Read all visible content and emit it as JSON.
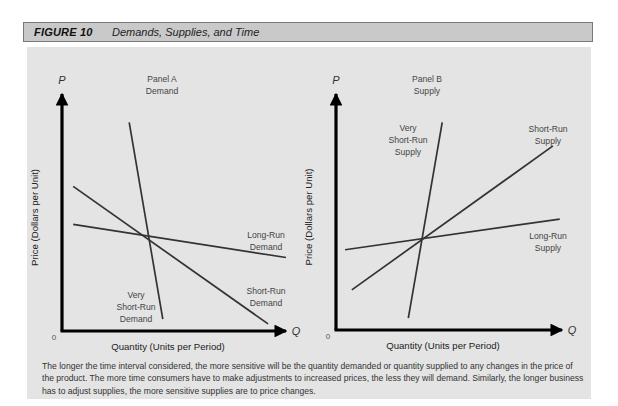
{
  "header": {
    "figure_number": "FIGURE 10",
    "title": "Demands, Supplies, and Time"
  },
  "caption": "The longer the time interval considered, the more sensitive will be the quantity demanded or quantity supplied to any changes in the price of the product. The more time consumers have to make adjustments to increased prices, the less they will demand. Similarly, the longer business has to adjust supplies, the more sensitive supplies are to price changes.",
  "colors": {
    "header_bg": "#c9c9c9",
    "panel_bg": "#e4e4e4",
    "axis": "#000000",
    "curve": "#333333",
    "label": "#444444"
  },
  "chart_data": [
    {
      "type": "line",
      "panel": "A",
      "title": "Panel A\nDemand",
      "title_lines": [
        "Panel A",
        "Demand"
      ],
      "xlabel": "Quantity (Units per Period)",
      "ylabel": "Price (Dollars per Unit)",
      "x_axis_symbol": "Q",
      "y_axis_symbol": "P",
      "origin_label": "0",
      "grid": false,
      "series": [
        {
          "name": "Very Short-Run Demand",
          "label_lines": [
            "Very",
            "Short-Run",
            "Demand"
          ],
          "points": [
            [
              0.3,
              0.88
            ],
            [
              0.45,
              0.05
            ]
          ]
        },
        {
          "name": "Short-Run Demand",
          "label_lines": [
            "Short-Run",
            "Demand"
          ],
          "points": [
            [
              0.05,
              0.61
            ],
            [
              0.92,
              0.03
            ]
          ]
        },
        {
          "name": "Long-Run Demand",
          "label_lines": [
            "Long-Run",
            "Demand"
          ],
          "points": [
            [
              0.05,
              0.45
            ],
            [
              1.0,
              0.31
            ]
          ]
        }
      ],
      "intersection": [
        0.38,
        0.42
      ]
    },
    {
      "type": "line",
      "panel": "B",
      "title": "Panel B\nSupply",
      "title_lines": [
        "Panel B",
        "Supply"
      ],
      "xlabel": "Quantity (Units per Period)",
      "ylabel": "Price (Dollars per Unit)",
      "x_axis_symbol": "Q",
      "y_axis_symbol": "P",
      "origin_label": "0",
      "grid": false,
      "series": [
        {
          "name": "Very Short-Run Supply",
          "label_lines": [
            "Very",
            "Short-Run",
            "Supply"
          ],
          "points": [
            [
              0.32,
              0.05
            ],
            [
              0.47,
              0.88
            ]
          ]
        },
        {
          "name": "Short-Run Supply",
          "label_lines": [
            "Short-Run",
            "Supply"
          ],
          "points": [
            [
              0.07,
              0.17
            ],
            [
              0.96,
              0.78
            ]
          ]
        },
        {
          "name": "Long-Run Supply",
          "label_lines": [
            "Long-Run",
            "Supply"
          ],
          "points": [
            [
              0.04,
              0.34
            ],
            [
              0.99,
              0.47
            ]
          ]
        }
      ],
      "intersection": [
        0.38,
        0.4
      ]
    }
  ]
}
